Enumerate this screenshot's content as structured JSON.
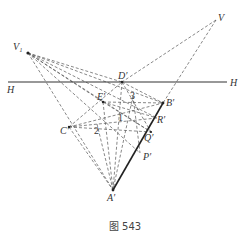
{
  "caption": "图 543",
  "colors": {
    "solid": "#333333",
    "dashed": "#555555",
    "background": "#ffffff"
  },
  "points": {
    "V1": {
      "label": "V₁",
      "x": 28,
      "y": 53
    },
    "V": {
      "label": "V",
      "x": 216,
      "y": 20
    },
    "D": {
      "label": "D′",
      "x": 122,
      "y": 82
    },
    "E": {
      "label": "E′",
      "x": 103,
      "y": 102
    },
    "B": {
      "label": "B′",
      "x": 163,
      "y": 103
    },
    "C": {
      "label": "C′",
      "x": 69,
      "y": 127
    },
    "A": {
      "label": "A′",
      "x": 113,
      "y": 190
    },
    "R": {
      "label": "R′",
      "x": 157,
      "y": 118
    },
    "Q": {
      "label": "Q′",
      "x": 151,
      "y": 132
    },
    "P": {
      "label": "P′",
      "x": 140,
      "y": 153
    }
  },
  "numbers": [
    {
      "label": "1",
      "x": 120,
      "y": 118
    },
    {
      "label": "2",
      "x": 97,
      "y": 131
    },
    {
      "label": "3",
      "x": 132,
      "y": 98
    }
  ],
  "horizon": {
    "label_left": "H",
    "label_right": "H",
    "x1": 8,
    "x2": 227,
    "y": 82
  }
}
